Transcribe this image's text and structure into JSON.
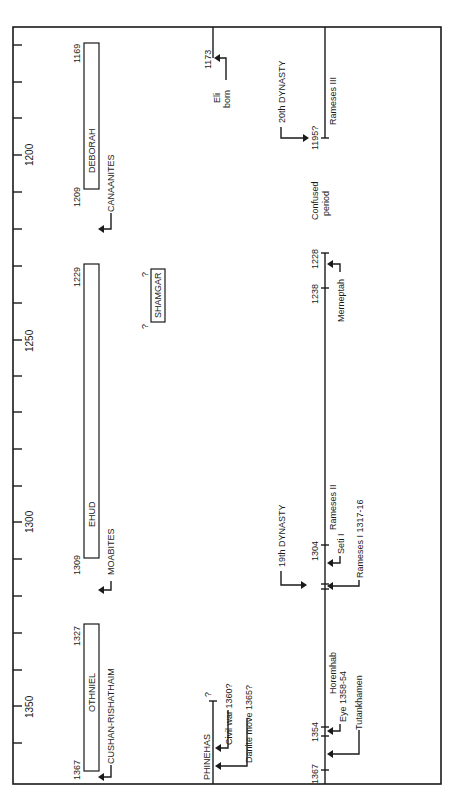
{
  "diagram": {
    "type": "timeline",
    "orientation": "rotated-90-ccw",
    "axis": {
      "tick_interval_years": 10,
      "labeled_ticks": [
        "1200",
        "1250",
        "1300",
        "1350"
      ],
      "range_years": [
        1165,
        1370
      ]
    },
    "judges": [
      {
        "name": "OTHNIEL",
        "start": "1367",
        "end": "1327",
        "oppressor": "CUSHAN-RISHATHAIM"
      },
      {
        "name": "EHUD",
        "start": "1309",
        "end": "1229",
        "oppressor": "MOABITES"
      },
      {
        "name": "DEBORAH",
        "start": "1209",
        "end": "1169",
        "oppressor": "CANAANITES"
      }
    ],
    "shamgar": {
      "name": "SHAMGAR",
      "q_start": "?",
      "q_end": "?"
    },
    "israel_line": {
      "phinehas_label": "PHINEHAS",
      "phinehas_end": "?",
      "events": [
        {
          "label": "Civil war 1360?"
        },
        {
          "label": "Danite move 1365?"
        }
      ],
      "eli": {
        "year": "1173",
        "label_line1": "Eli",
        "label_line2": "born"
      }
    },
    "egypt_line": {
      "ticks": [
        "1367",
        "1354",
        "1304",
        "1238",
        "1228",
        "1195?"
      ],
      "pharaohs": [
        {
          "label": "Tutankhamen"
        },
        {
          "label": "Eye 1358-54"
        },
        {
          "label": "Horemhab"
        },
        {
          "label": "Rameses I 1317-16"
        },
        {
          "label": "Seti I"
        },
        {
          "label": "Rameses II"
        },
        {
          "label": "Merneptah"
        },
        {
          "label": "Rameses III"
        }
      ],
      "dynasties": [
        {
          "label": "19th DYNASTY"
        },
        {
          "label": "20th DYNASTY"
        }
      ],
      "confused_line1": "Confused",
      "confused_line2": "period"
    }
  }
}
